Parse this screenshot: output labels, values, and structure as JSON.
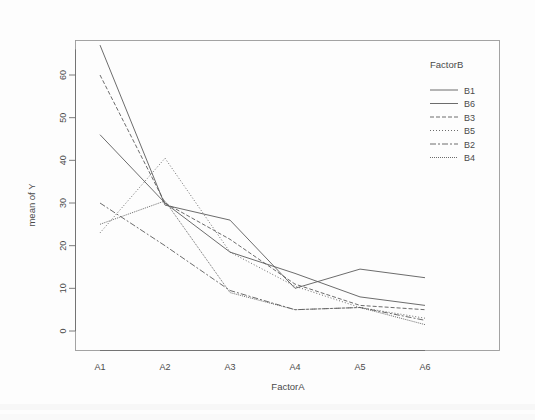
{
  "figure": {
    "background": "#fdfdfd",
    "ink_color": "#5b5b5b",
    "box_color": "#9a9a9a"
  },
  "axes": {
    "x_title": "FactorA",
    "y_title": "mean of  Y",
    "x_tick_labels": [
      "A1",
      "A2",
      "A3",
      "A4",
      "A5",
      "A6"
    ],
    "y_tick_labels": [
      "0",
      "10",
      "20",
      "30",
      "40",
      "50",
      "60"
    ]
  },
  "legend": {
    "title": "FactorB",
    "entries": [
      {
        "label": "B1",
        "dash": "none"
      },
      {
        "label": "B6",
        "dash": "none"
      },
      {
        "label": "B3",
        "dash": "4 2"
      },
      {
        "label": "B5",
        "dash": "1 2"
      },
      {
        "label": "B2",
        "dash": "6 2 2 2"
      },
      {
        "label": "B4",
        "dash": "1 1"
      }
    ]
  },
  "chart_data": {
    "type": "line",
    "title": "",
    "subtitle": "",
    "xlabel": "FactorA",
    "ylabel": "mean of  Y",
    "categories": [
      "A1",
      "A2",
      "A3",
      "A4",
      "A5",
      "A6"
    ],
    "ylim": [
      0,
      68
    ],
    "xlim": [
      0,
      7
    ],
    "yticks": [
      0,
      10,
      20,
      30,
      40,
      50,
      60
    ],
    "grid": false,
    "legend_position": "top-right",
    "legend_title": "FactorB",
    "series": [
      {
        "name": "B1",
        "dash": "none",
        "values": [
          46,
          30,
          18.5,
          13.5,
          8,
          6
        ]
      },
      {
        "name": "B6",
        "dash": "none",
        "values": [
          67,
          29.5,
          26,
          10,
          14.5,
          12.5
        ]
      },
      {
        "name": "B3",
        "dash": "4 2",
        "values": [
          60,
          30,
          21.5,
          11,
          6,
          5
        ]
      },
      {
        "name": "B5",
        "dash": "1 2",
        "values": [
          23,
          40.5,
          18.5,
          10.5,
          5.5,
          3
        ]
      },
      {
        "name": "B2",
        "dash": "6 2 2 2",
        "values": [
          30,
          20,
          9.5,
          5,
          5.5,
          2.5
        ]
      },
      {
        "name": "B4",
        "dash": "1 1",
        "values": [
          25,
          30.5,
          9,
          5,
          5.5,
          1.5
        ]
      }
    ]
  }
}
